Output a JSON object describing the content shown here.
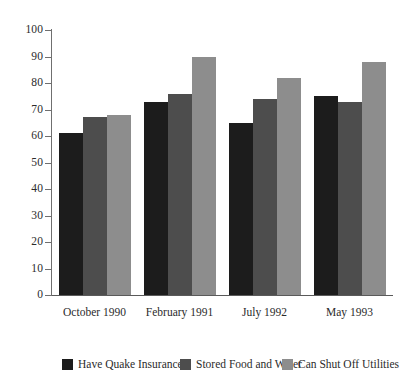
{
  "chart_data": {
    "type": "bar",
    "title": "",
    "subtitle": "",
    "xlabel": "",
    "ylabel": "",
    "categories": [
      "October 1990",
      "February 1991",
      "July 1992",
      "May 1993"
    ],
    "series": [
      {
        "name": "Have Quake Insurance",
        "color": "#1c1c1c",
        "values": [
          61,
          73,
          65,
          75
        ]
      },
      {
        "name": "Stored Food and Water",
        "color": "#4d4d4d",
        "values": [
          67,
          76,
          74,
          73
        ]
      },
      {
        "name": "Can Shut Off Utilities",
        "color": "#8d8d8d",
        "values": [
          68,
          90,
          82,
          88
        ]
      }
    ],
    "ylim": [
      0,
      100
    ],
    "ytick_step": 10,
    "yticks": [
      0,
      10,
      20,
      30,
      40,
      50,
      60,
      70,
      80,
      90,
      100
    ],
    "ytick_labels": [
      "0",
      "10",
      "20",
      "30",
      "40",
      "50",
      "60",
      "70",
      "80",
      "90",
      "100"
    ],
    "grid": false,
    "legend_position": "bottom",
    "axis_color": "#6f6f6f",
    "background": "#ffffff"
  }
}
